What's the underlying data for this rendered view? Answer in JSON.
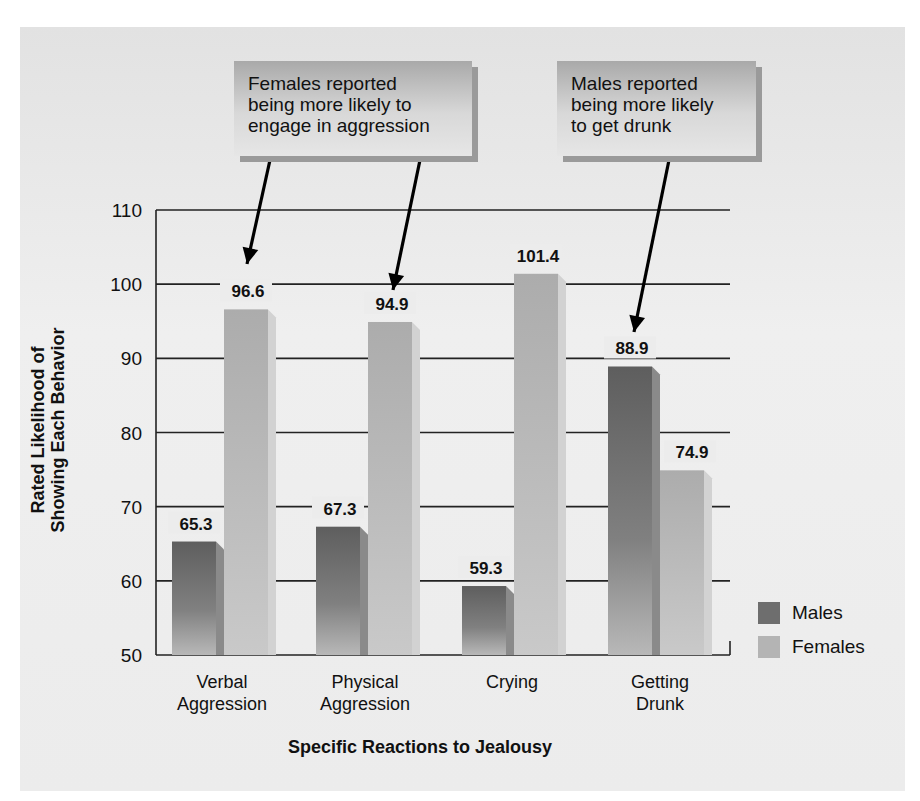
{
  "chart_data": {
    "type": "bar",
    "title": "",
    "xlabel": "Specific Reactions to Jealousy",
    "ylabel": "Rated Likelihood of Showing Each Behavior",
    "ylabel_lines": [
      "Rated Likelihood of",
      "Showing Each Behavior"
    ],
    "categories": [
      "Verbal Aggression",
      "Physical Aggression",
      "Crying",
      "Getting Drunk"
    ],
    "category_lines": [
      [
        "Verbal",
        "Aggression"
      ],
      [
        "Physical",
        "Aggression"
      ],
      [
        "Crying"
      ],
      [
        "Getting",
        "Drunk"
      ]
    ],
    "series": [
      {
        "name": "Males",
        "values": [
          65.3,
          67.3,
          59.3,
          88.9
        ],
        "color": "#6e6e6e"
      },
      {
        "name": "Females",
        "values": [
          96.6,
          94.9,
          101.4,
          74.9
        ],
        "color": "#b4b4b4"
      }
    ],
    "ylim": [
      50,
      110
    ],
    "yticks": [
      50,
      60,
      70,
      80,
      90,
      100,
      110
    ],
    "grid": true,
    "legend_position": "right-bottom",
    "annotations": [
      {
        "text_lines": [
          "Females reported",
          "being more likely to",
          "engage in aggression"
        ],
        "points_to": [
          "Verbal Aggression - Females",
          "Physical Aggression - Females"
        ]
      },
      {
        "text_lines": [
          "Males reported",
          "being more likely",
          "to get drunk"
        ],
        "points_to": [
          "Getting Drunk - Males"
        ]
      }
    ]
  },
  "legend": {
    "males": "Males",
    "females": "Females"
  }
}
